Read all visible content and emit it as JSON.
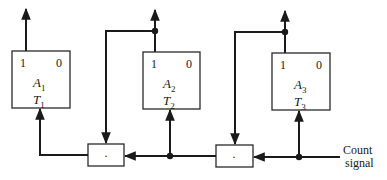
{
  "diagram": {
    "type": "binary counter (T flip-flops with AND gates)",
    "flip_flops": [
      {
        "id": "A1",
        "output_1": "1",
        "output_0": "0",
        "name": "A",
        "name_sub": "1",
        "input": "T",
        "input_sub": "1"
      },
      {
        "id": "A2",
        "output_1": "1",
        "output_0": "0",
        "name": "A",
        "name_sub": "2",
        "input": "T",
        "input_sub": "2"
      },
      {
        "id": "A3",
        "output_1": "1",
        "output_0": "0",
        "name": "A",
        "name_sub": "3",
        "input": "T",
        "input_sub": "3"
      }
    ],
    "and_gates": [
      {
        "id": "gate1",
        "symbol": "·"
      },
      {
        "id": "gate2",
        "symbol": "·"
      }
    ],
    "input_signal": {
      "line1": "Count",
      "line2": "signal"
    },
    "colors": {
      "stroke": "#1a1a1a",
      "background": "#ffffff"
    }
  }
}
